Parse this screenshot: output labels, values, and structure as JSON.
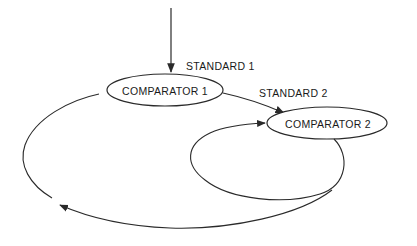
{
  "diagram": {
    "nodes": [
      {
        "id": "c1",
        "label": "COMPARATOR 1"
      },
      {
        "id": "c2",
        "label": "COMPARATOR 2"
      }
    ],
    "edge_labels": {
      "standard1": "STANDARD 1",
      "standard2": "STANDARD 2"
    },
    "edges": [
      {
        "from": "input",
        "to": "c1",
        "label": "STANDARD 1"
      },
      {
        "from": "c1",
        "to": "c2",
        "label": "STANDARD 2"
      },
      {
        "from": "c2",
        "to": "c2",
        "type": "inner-loop"
      },
      {
        "from": "c2",
        "to": "c1",
        "type": "outer-loop"
      }
    ],
    "stroke_color": "#2a2a2a"
  }
}
